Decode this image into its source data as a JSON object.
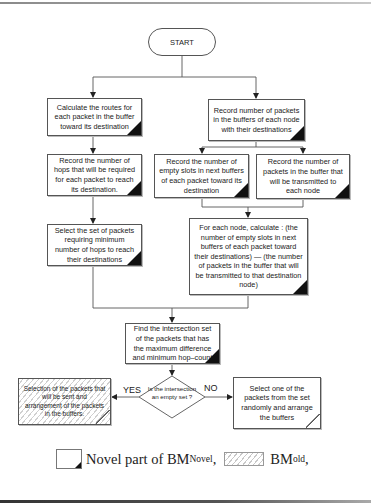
{
  "flowchart": {
    "start": {
      "label": "START"
    },
    "boxes": {
      "calc_routes": {
        "text": "Calculate the routes for each packet in the buffer toward its destination",
        "type": "novel"
      },
      "record_packets": {
        "text": "Record number of packets in the buffers of each node with their destinations",
        "type": "novel"
      },
      "record_hops": {
        "text": "Record the number of hops that will be required for each packet to reach its destination.",
        "type": "novel"
      },
      "record_empty_slots": {
        "text": "Record the number of empty slots in next buffers of each packet toward its destination",
        "type": "novel"
      },
      "record_transmitted": {
        "text": "Record the number of packets in the buffer that will be transmitted to each node",
        "type": "novel"
      },
      "select_min_hops": {
        "text": "Select the set of packets requiring minimum number of hops to reach their destinations",
        "type": "novel"
      },
      "calc_difference": {
        "text": "For each node, calculate : (the number of empty slots in next buffers of each packet toward their destinations) — (the number of packets in the buffer that will be transmitted to that destination node)",
        "type": "novel"
      },
      "find_intersection": {
        "text": "Find the intersection set of the packets that has the maximum difference and minimum hop–count",
        "type": "novel"
      },
      "select_arrange_old": {
        "text": "Selection of the packets that will be sent and arrangement of the packets in the buffers.",
        "type": "old"
      },
      "select_random": {
        "text": "Select one of the packets from the set randomly and arrange the buffers",
        "type": "old-plain"
      }
    },
    "decision": {
      "text": "Is the intersection an empty set ?",
      "yes_label": "YES",
      "no_label": "NO"
    }
  },
  "legend": {
    "novel_label": "Novel part of BM",
    "novel_sub": "Novel",
    "novel_suffix": ",",
    "old_label": "BM",
    "old_sub": "old",
    "old_suffix": ","
  },
  "colors": {
    "line": "#555555",
    "corner_fill": "#111111",
    "hatch": "#d0d0d0"
  }
}
